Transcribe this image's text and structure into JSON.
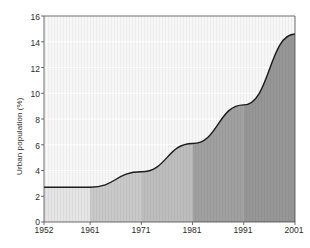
{
  "chart_data": {
    "type": "area",
    "title": "",
    "xlabel": "",
    "ylabel": "Urban population (%)",
    "x": [
      1952,
      1961,
      1971,
      1981,
      1991,
      2001
    ],
    "values": [
      2.7,
      2.7,
      3.9,
      6.1,
      9.1,
      14.6
    ],
    "series": [
      {
        "name": "Urban population",
        "values": [
          2.7,
          2.7,
          3.9,
          6.1,
          9.1,
          14.6
        ]
      }
    ],
    "xtick_labels": [
      "1952",
      "1961",
      "1971",
      "1981",
      "1991",
      "2001"
    ],
    "ytick_labels": [
      "0",
      "2",
      "4",
      "6",
      "8",
      "10",
      "12",
      "14",
      "16"
    ],
    "ytick_values": [
      0,
      2,
      4,
      6,
      8,
      10,
      12,
      14,
      16
    ],
    "xlim": [
      1952,
      2001
    ],
    "ylim": [
      0,
      16
    ],
    "grid": true,
    "legend": false,
    "legend_position": "none",
    "annotations": [],
    "colors": {
      "line": "#1a1a1a",
      "plot_background": "#f7f7f7",
      "gridline": "#ffffff",
      "band_1": "#e4e4e4",
      "band_2": "#c9c9c9",
      "band_3": "#bdbdbd",
      "band_4": "#a0a0a0",
      "band_5": "#969696",
      "axis_text": "#2b2b2b",
      "page_background": "#ffffff"
    }
  },
  "axis": {
    "y_title": "Urban population (%)"
  }
}
